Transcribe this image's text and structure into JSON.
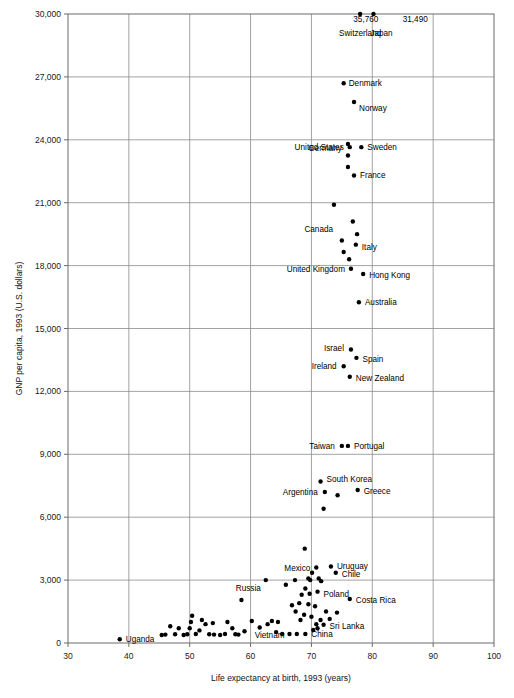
{
  "chart_data": {
    "type": "scatter",
    "title": "",
    "xlabel": "Life expectancy at birth, 1993 (years)",
    "ylabel": "GNP per capita, 1993 (U.S. dollars)",
    "xlim": [
      30,
      100
    ],
    "ylim": [
      0,
      30000
    ],
    "xticks": [
      30,
      40,
      50,
      60,
      70,
      80,
      90,
      100
    ],
    "xtick_labels": [
      "30",
      "40",
      "50",
      "60",
      "70",
      "80",
      "90",
      "100"
    ],
    "yticks": [
      0,
      3000,
      6000,
      9000,
      12000,
      15000,
      18000,
      21000,
      24000,
      27000,
      30000
    ],
    "ytick_labels": [
      "0",
      "3,000",
      "6,000",
      "9,000",
      "12,000",
      "15,000",
      "18,000",
      "21,000",
      "24,000",
      "27,000",
      "30,000"
    ],
    "grid": true,
    "grid_x": [
      40,
      50,
      60,
      70,
      80,
      90
    ],
    "grid_y": [
      3000,
      6000,
      9000,
      12000,
      15000,
      18000,
      21000,
      24000,
      27000
    ],
    "legend": null,
    "annotations": [
      {
        "text": "35,760",
        "x": 81.0,
        "y": 30050,
        "anchor": "end",
        "note": "value callout for Switzerland, point clipped at axis top"
      },
      {
        "text": "31,490",
        "x": 85.0,
        "y": 30050,
        "anchor": "start",
        "note": "value callout for Japan, point clipped at axis top"
      }
    ],
    "point_radius": 2.2,
    "points": [
      {
        "label": "Switzerland",
        "x": 78.0,
        "y": 30000,
        "label_pos": "below",
        "label_dx": 0,
        "label_dy": 22,
        "value_text": "35,760"
      },
      {
        "label": "Japan",
        "x": 80.2,
        "y": 30000,
        "label_pos": "below",
        "label_dx": 8,
        "label_dy": 22,
        "value_text": "31,490"
      },
      {
        "label": "Denmark",
        "x": 75.3,
        "y": 26700,
        "label_pos": "right",
        "label_dx": 5,
        "label_dy": 3
      },
      {
        "label": "Norway",
        "x": 77.0,
        "y": 25800,
        "label_pos": "right",
        "label_dx": 5,
        "label_dy": 9
      },
      {
        "label": "United States",
        "x": 76.3,
        "y": 23650,
        "label_pos": "left",
        "label_dx": -6,
        "label_dy": 3
      },
      {
        "label": "Sweden",
        "x": 78.2,
        "y": 23650,
        "label_pos": "right",
        "label_dx": 6,
        "label_dy": 3
      },
      {
        "label": "Germany",
        "x": 76.0,
        "y": 23800,
        "label_pos": "left",
        "label_dx": -6,
        "label_dy": 7,
        "note": "cluster of three stacked points"
      },
      {
        "label": "",
        "x": 76.0,
        "y": 23250,
        "label_pos": "none"
      },
      {
        "label": "",
        "x": 76.0,
        "y": 22700,
        "label_pos": "none"
      },
      {
        "label": "France",
        "x": 77.0,
        "y": 22300,
        "label_pos": "right",
        "label_dx": 6,
        "label_dy": 3
      },
      {
        "label": "",
        "x": 73.7,
        "y": 20900,
        "label_pos": "none"
      },
      {
        "label": "",
        "x": 76.8,
        "y": 20100,
        "label_pos": "none"
      },
      {
        "label": "Canada",
        "x": 77.5,
        "y": 19500,
        "label_pos": "left",
        "label_dx": -24,
        "label_dy": -2
      },
      {
        "label": "",
        "x": 75.0,
        "y": 19200,
        "label_pos": "none"
      },
      {
        "label": "Italy",
        "x": 77.3,
        "y": 19000,
        "label_pos": "right",
        "label_dx": 6,
        "label_dy": 5
      },
      {
        "label": "",
        "x": 75.3,
        "y": 18650,
        "label_pos": "none"
      },
      {
        "label": "",
        "x": 76.2,
        "y": 18300,
        "label_pos": "none"
      },
      {
        "label": "United Kingdom",
        "x": 76.5,
        "y": 17850,
        "label_pos": "left",
        "label_dx": -6,
        "label_dy": 3
      },
      {
        "label": "Hong Kong",
        "x": 78.5,
        "y": 17600,
        "label_pos": "right",
        "label_dx": 6,
        "label_dy": 4
      },
      {
        "label": "Australia",
        "x": 77.8,
        "y": 16250,
        "label_pos": "right",
        "label_dx": 6,
        "label_dy": 3
      },
      {
        "label": "Israel",
        "x": 76.5,
        "y": 14000,
        "label_pos": "left",
        "label_dx": -7,
        "label_dy": 2
      },
      {
        "label": "Spain",
        "x": 77.4,
        "y": 13600,
        "label_pos": "right",
        "label_dx": 6,
        "label_dy": 4
      },
      {
        "label": "Ireland",
        "x": 75.3,
        "y": 13200,
        "label_pos": "left",
        "label_dx": -7,
        "label_dy": 3
      },
      {
        "label": "New Zealand",
        "x": 76.3,
        "y": 12700,
        "label_pos": "right",
        "label_dx": 6,
        "label_dy": 4
      },
      {
        "label": "Taiwan",
        "x": 75.0,
        "y": 9400,
        "label_pos": "left",
        "label_dx": -7,
        "label_dy": 3
      },
      {
        "label": "Portugal",
        "x": 76.0,
        "y": 9400,
        "label_pos": "right",
        "label_dx": 6,
        "label_dy": 3
      },
      {
        "label": "South Korea",
        "x": 71.5,
        "y": 7700,
        "label_pos": "right",
        "label_dx": 6,
        "label_dy": 0
      },
      {
        "label": "Argentina",
        "x": 72.2,
        "y": 7200,
        "label_pos": "left",
        "label_dx": -7,
        "label_dy": 3
      },
      {
        "label": "",
        "x": 74.3,
        "y": 7050,
        "label_pos": "none"
      },
      {
        "label": "Greece",
        "x": 77.6,
        "y": 7300,
        "label_pos": "right",
        "label_dx": 6,
        "label_dy": 4
      },
      {
        "label": "",
        "x": 72.0,
        "y": 6400,
        "label_pos": "none"
      },
      {
        "label": "",
        "x": 68.9,
        "y": 4500,
        "label_pos": "none"
      },
      {
        "label": "Uruguay",
        "x": 73.2,
        "y": 3650,
        "label_pos": "right",
        "label_dx": 6,
        "label_dy": 3
      },
      {
        "label": "Mexico",
        "x": 70.8,
        "y": 3600,
        "label_pos": "left",
        "label_dx": -6,
        "label_dy": 3
      },
      {
        "label": "",
        "x": 70.1,
        "y": 3350,
        "label_pos": "none"
      },
      {
        "label": "Chile",
        "x": 74.0,
        "y": 3350,
        "label_pos": "right",
        "label_dx": 6,
        "label_dy": 4
      },
      {
        "label": "",
        "x": 69.5,
        "y": 3080,
        "label_pos": "none"
      },
      {
        "label": "",
        "x": 71.2,
        "y": 3080,
        "label_pos": "none"
      },
      {
        "label": "Russia",
        "x": 62.5,
        "y": 3000,
        "label_pos": "left",
        "label_dx": -5,
        "label_dy": 11
      },
      {
        "label": "",
        "x": 65.8,
        "y": 2780,
        "label_pos": "none"
      },
      {
        "label": "",
        "x": 67.3,
        "y": 3000,
        "label_pos": "none"
      },
      {
        "label": "",
        "x": 69.8,
        "y": 3000,
        "label_pos": "none"
      },
      {
        "label": "",
        "x": 71.6,
        "y": 2950,
        "label_pos": "none"
      },
      {
        "label": "",
        "x": 69.0,
        "y": 2600,
        "label_pos": "none"
      },
      {
        "label": "Poland",
        "x": 71.0,
        "y": 2450,
        "label_pos": "right",
        "label_dx": 6,
        "label_dy": 5
      },
      {
        "label": "",
        "x": 69.7,
        "y": 2350,
        "label_pos": "none"
      },
      {
        "label": "",
        "x": 68.4,
        "y": 2300,
        "label_pos": "none"
      },
      {
        "label": "Costa Rica",
        "x": 76.3,
        "y": 2100,
        "label_pos": "right",
        "label_dx": 6,
        "label_dy": 4
      },
      {
        "label": "",
        "x": 58.5,
        "y": 2050,
        "label_pos": "none"
      },
      {
        "label": "",
        "x": 68.0,
        "y": 1900,
        "label_pos": "none"
      },
      {
        "label": "",
        "x": 69.5,
        "y": 1850,
        "label_pos": "none"
      },
      {
        "label": "",
        "x": 70.6,
        "y": 1750,
        "label_pos": "none"
      },
      {
        "label": "",
        "x": 72.4,
        "y": 1500,
        "label_pos": "none"
      },
      {
        "label": "",
        "x": 74.2,
        "y": 1450,
        "label_pos": "none"
      },
      {
        "label": "",
        "x": 67.4,
        "y": 1500,
        "label_pos": "none"
      },
      {
        "label": "",
        "x": 68.8,
        "y": 1350,
        "label_pos": "none"
      },
      {
        "label": "",
        "x": 70.0,
        "y": 1250,
        "label_pos": "none"
      },
      {
        "label": "",
        "x": 71.5,
        "y": 1100,
        "label_pos": "none"
      },
      {
        "label": "Sri Lanka",
        "x": 72.0,
        "y": 870,
        "label_pos": "right",
        "label_dx": 6,
        "label_dy": 4
      },
      {
        "label": "",
        "x": 71.0,
        "y": 700,
        "label_pos": "none"
      },
      {
        "label": "",
        "x": 70.3,
        "y": 620,
        "label_pos": "none"
      },
      {
        "label": "China",
        "x": 69.0,
        "y": 430,
        "label_pos": "right",
        "label_dx": 6,
        "label_dy": 3
      },
      {
        "label": "",
        "x": 67.6,
        "y": 430,
        "label_pos": "none"
      },
      {
        "label": "Vietnam",
        "x": 66.4,
        "y": 430,
        "label_pos": "left",
        "label_dx": -5,
        "label_dy": 4
      },
      {
        "label": "",
        "x": 65.2,
        "y": 430,
        "label_pos": "none"
      },
      {
        "label": "",
        "x": 64.2,
        "y": 520,
        "label_pos": "none"
      },
      {
        "label": "",
        "x": 63.5,
        "y": 1050,
        "label_pos": "none"
      },
      {
        "label": "",
        "x": 64.5,
        "y": 1000,
        "label_pos": "none"
      },
      {
        "label": "",
        "x": 62.8,
        "y": 900,
        "label_pos": "none"
      },
      {
        "label": "",
        "x": 61.5,
        "y": 740,
        "label_pos": "none"
      },
      {
        "label": "",
        "x": 60.2,
        "y": 1050,
        "label_pos": "none"
      },
      {
        "label": "",
        "x": 59.0,
        "y": 560,
        "label_pos": "none"
      },
      {
        "label": "",
        "x": 57.5,
        "y": 420,
        "label_pos": "none"
      },
      {
        "label": "",
        "x": 56.2,
        "y": 1000,
        "label_pos": "none"
      },
      {
        "label": "",
        "x": 55.0,
        "y": 380,
        "label_pos": "none"
      },
      {
        "label": "",
        "x": 54.0,
        "y": 400,
        "label_pos": "none"
      },
      {
        "label": "",
        "x": 53.2,
        "y": 420,
        "label_pos": "none"
      },
      {
        "label": "",
        "x": 52.6,
        "y": 900,
        "label_pos": "none"
      },
      {
        "label": "",
        "x": 52.0,
        "y": 1100,
        "label_pos": "none"
      },
      {
        "label": "",
        "x": 51.6,
        "y": 600,
        "label_pos": "none"
      },
      {
        "label": "",
        "x": 51.0,
        "y": 430,
        "label_pos": "none"
      },
      {
        "label": "",
        "x": 50.4,
        "y": 1300,
        "label_pos": "none"
      },
      {
        "label": "",
        "x": 50.2,
        "y": 1000,
        "label_pos": "none"
      },
      {
        "label": "",
        "x": 50.0,
        "y": 700,
        "label_pos": "none"
      },
      {
        "label": "",
        "x": 49.6,
        "y": 420,
        "label_pos": "none"
      },
      {
        "label": "",
        "x": 49.0,
        "y": 380,
        "label_pos": "none"
      },
      {
        "label": "",
        "x": 48.2,
        "y": 700,
        "label_pos": "none"
      },
      {
        "label": "",
        "x": 47.6,
        "y": 420,
        "label_pos": "none"
      },
      {
        "label": "",
        "x": 46.8,
        "y": 800,
        "label_pos": "none"
      },
      {
        "label": "",
        "x": 46.0,
        "y": 400,
        "label_pos": "none"
      },
      {
        "label": "",
        "x": 45.4,
        "y": 380,
        "label_pos": "none"
      },
      {
        "label": "",
        "x": 53.8,
        "y": 950,
        "label_pos": "none"
      },
      {
        "label": "",
        "x": 55.8,
        "y": 430,
        "label_pos": "none"
      },
      {
        "label": "",
        "x": 57.0,
        "y": 700,
        "label_pos": "none"
      },
      {
        "label": "",
        "x": 58.0,
        "y": 400,
        "label_pos": "none"
      },
      {
        "label": "Uganda",
        "x": 38.5,
        "y": 180,
        "label_pos": "right",
        "label_dx": 6,
        "label_dy": 3
      },
      {
        "label": "",
        "x": 66.8,
        "y": 1800,
        "label_pos": "none"
      },
      {
        "label": "",
        "x": 68.2,
        "y": 1100,
        "label_pos": "none"
      },
      {
        "label": "",
        "x": 73.0,
        "y": 1150,
        "label_pos": "none"
      },
      {
        "label": "",
        "x": 70.8,
        "y": 900,
        "label_pos": "none"
      }
    ]
  }
}
